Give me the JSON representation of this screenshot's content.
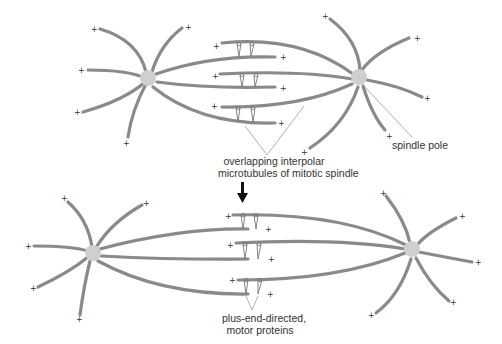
{
  "figure": {
    "top_panel": {
      "label_overlap": [
        "overlapping interpolar",
        "microtubules of mitotic spindle"
      ],
      "label_pole": "spindle pole"
    },
    "bottom_panel": {
      "label_motor": [
        "plus-end-directed,",
        "motor proteins"
      ]
    },
    "plus_symbol": "+",
    "colors": {
      "microtubule": "#8a8a8a",
      "pole": "#cfcfcf",
      "text": "#333333",
      "arrow": "#111111"
    }
  }
}
